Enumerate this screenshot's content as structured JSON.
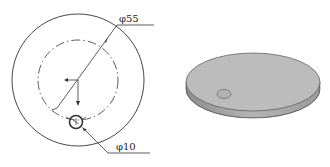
{
  "drawing": {
    "outer_diameter_label": "φ55",
    "hole_diameter_label": "φ10"
  },
  "colors": {
    "line": "#333333",
    "disc_top": "#bdbdbd",
    "disc_side": "#a6a6a6",
    "hole": "#b0b0b0"
  }
}
